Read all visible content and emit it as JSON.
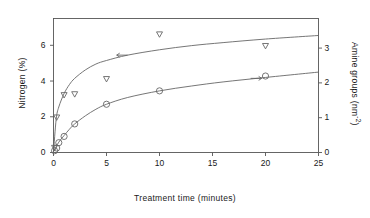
{
  "chart_data": {
    "type": "scatter",
    "title": "",
    "xlabel": "Treatment time (minutes)",
    "ylabel": "Nitrogen (%)",
    "ylabel_right": "Amine groups (nm",
    "ylabel_right_sup": "-2",
    "ylabel_right_close": ")",
    "xlim": [
      0,
      25
    ],
    "ylim": [
      0,
      7.5
    ],
    "ylim_right": [
      0,
      3.85
    ],
    "grid": false,
    "legend": "none",
    "xticks": [
      0,
      5,
      10,
      15,
      20,
      25
    ],
    "xtick_labels": [
      "0",
      "5",
      "10",
      "15",
      "20",
      "25"
    ],
    "yticks_left": [
      0,
      2,
      4,
      6
    ],
    "ytick_labels_left": [
      "0",
      "2",
      "4",
      "6"
    ],
    "yticks_right": [
      0,
      1,
      2,
      3
    ],
    "ytick_labels_right": [
      "0",
      "1",
      "2",
      "3"
    ],
    "series": [
      {
        "name": "Nitrogen",
        "marker": "triangle-down",
        "axis": "left",
        "arrow": "left-arrow",
        "arrow_x": 7.0,
        "arrow_y": 5.45,
        "points": [
          {
            "x": 0.1,
            "y": 0.25
          },
          {
            "x": 0.3,
            "y": 1.95
          },
          {
            "x": 1.0,
            "y": 3.2
          },
          {
            "x": 2.0,
            "y": 3.25
          },
          {
            "x": 5.0,
            "y": 4.1
          },
          {
            "x": 10.0,
            "y": 6.6
          },
          {
            "x": 20.0,
            "y": 5.95
          }
        ],
        "curve": [
          {
            "x": 0.0,
            "y": 0.0
          },
          {
            "x": 0.25,
            "y": 1.85
          },
          {
            "x": 0.5,
            "y": 2.55
          },
          {
            "x": 1.0,
            "y": 3.3
          },
          {
            "x": 1.5,
            "y": 3.8
          },
          {
            "x": 2.0,
            "y": 4.15
          },
          {
            "x": 3.0,
            "y": 4.62
          },
          {
            "x": 4.0,
            "y": 4.95
          },
          {
            "x": 5.0,
            "y": 5.15
          },
          {
            "x": 7.0,
            "y": 5.45
          },
          {
            "x": 10.0,
            "y": 5.75
          },
          {
            "x": 13.0,
            "y": 5.98
          },
          {
            "x": 16.0,
            "y": 6.15
          },
          {
            "x": 20.0,
            "y": 6.35
          },
          {
            "x": 25.0,
            "y": 6.55
          }
        ]
      },
      {
        "name": "Amine groups",
        "marker": "circle",
        "axis": "right",
        "arrow": "right-arrow",
        "arrow_x": 18.6,
        "arrow_y": 4.15,
        "points": [
          {
            "x": 0.1,
            "y": 0.1
          },
          {
            "x": 0.3,
            "y": 0.25
          },
          {
            "x": 0.5,
            "y": 0.55
          },
          {
            "x": 1.0,
            "y": 0.9
          },
          {
            "x": 2.0,
            "y": 1.6
          },
          {
            "x": 5.0,
            "y": 2.7
          },
          {
            "x": 10.0,
            "y": 3.45
          },
          {
            "x": 20.0,
            "y": 4.28
          }
        ],
        "curve": [
          {
            "x": 0.0,
            "y": 0.05
          },
          {
            "x": 0.5,
            "y": 0.58
          },
          {
            "x": 1.0,
            "y": 0.95
          },
          {
            "x": 1.5,
            "y": 1.3
          },
          {
            "x": 2.0,
            "y": 1.6
          },
          {
            "x": 3.0,
            "y": 2.05
          },
          {
            "x": 4.0,
            "y": 2.42
          },
          {
            "x": 5.0,
            "y": 2.7
          },
          {
            "x": 7.0,
            "y": 3.08
          },
          {
            "x": 10.0,
            "y": 3.45
          },
          {
            "x": 13.0,
            "y": 3.72
          },
          {
            "x": 16.0,
            "y": 3.95
          },
          {
            "x": 20.0,
            "y": 4.2
          },
          {
            "x": 25.0,
            "y": 4.5
          }
        ]
      }
    ],
    "colors": {
      "axis": "#555555",
      "curve": "#666666",
      "marker": "#666666",
      "text": "#1a1a1a"
    }
  }
}
